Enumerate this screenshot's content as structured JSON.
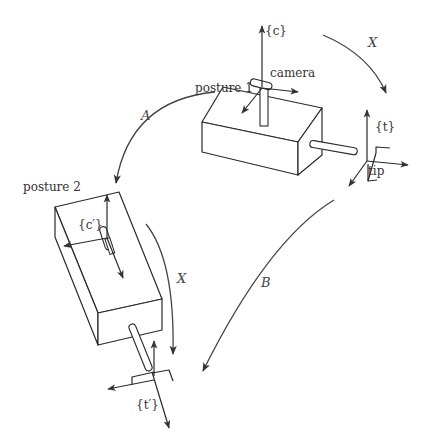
{
  "diagram": {
    "labels": {
      "posture1": "posture 1",
      "posture2": "posture 2",
      "camera": "camera",
      "camera_frame": "{c}",
      "camera_frame_prime": "{c′}",
      "tip": "tip",
      "tip_frame": "{t}",
      "tip_frame_prime": "{t′}"
    },
    "transforms": {
      "A": "A",
      "B": "B",
      "X_top": "X",
      "X_left": "X"
    },
    "colors": {
      "line": "#2a2a2a",
      "arrow": "#444444",
      "background": "#ffffff"
    }
  }
}
